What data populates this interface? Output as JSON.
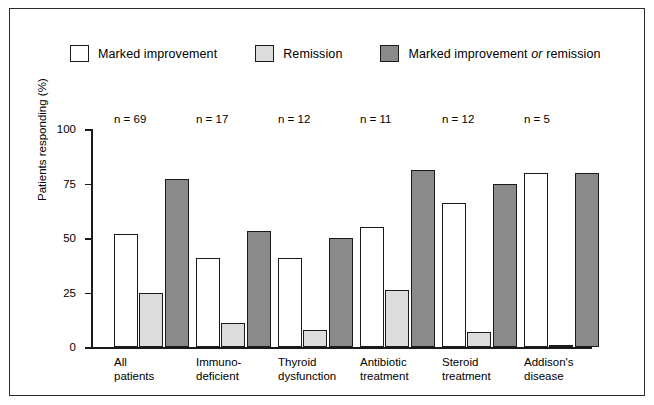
{
  "legend": {
    "items": [
      {
        "label": "Marked improvement",
        "color": "#ffffff",
        "icon": "legend-swatch-white"
      },
      {
        "label": "Remission",
        "color": "#dcdcdc",
        "icon": "legend-swatch-light-grey"
      },
      {
        "label": "Marked improvement ",
        "label_italic": "or",
        "label_tail": " remission",
        "color": "#8a8a8a",
        "icon": "legend-swatch-dark-grey"
      }
    ]
  },
  "chart_data": {
    "type": "bar",
    "title": "",
    "xlabel": "",
    "ylabel": "Patients responding (%)",
    "ylim": [
      0,
      100
    ],
    "yticks": [
      0,
      25,
      50,
      75,
      100
    ],
    "ytick_labels": [
      "0",
      "25",
      "50",
      "75",
      "100"
    ],
    "grid": false,
    "legend_position": "top-left",
    "categories": [
      "All patients",
      "Immuno-deficient",
      "Thyroid dysfunction",
      "Antibiotic treatment",
      "Steroid treatment",
      "Addison's disease"
    ],
    "category_lines": [
      [
        "All",
        "patients"
      ],
      [
        "Immuno-",
        "deficient"
      ],
      [
        "Thyroid",
        "dysfunction"
      ],
      [
        "Antibiotic",
        "treatment"
      ],
      [
        "Steroid",
        "treatment"
      ],
      [
        "Addison's",
        "disease"
      ]
    ],
    "group_annotations": [
      "n = 69",
      "n = 17",
      "n = 12",
      "n = 11",
      "n = 12",
      "n = 5"
    ],
    "series": [
      {
        "name": "Marked improvement",
        "color": "#ffffff",
        "values": [
          52,
          41,
          41,
          55,
          66,
          80
        ]
      },
      {
        "name": "Remission",
        "color": "#dcdcdc",
        "values": [
          25,
          11,
          8,
          26,
          7,
          1
        ]
      },
      {
        "name": "Marked improvement or remission",
        "color": "#8a8a8a",
        "values": [
          77,
          53,
          50,
          81,
          75,
          80
        ]
      }
    ]
  }
}
